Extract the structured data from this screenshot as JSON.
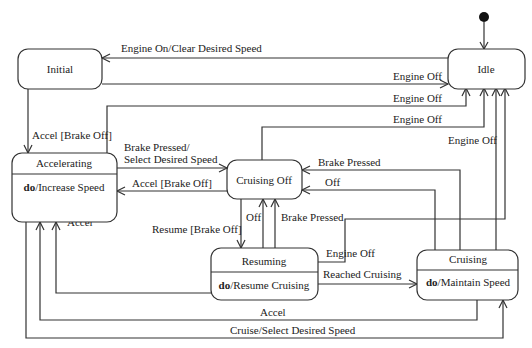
{
  "diagram": {
    "type": "uml-state-machine",
    "initial_pseudostate": {
      "target": "Idle"
    },
    "states": [
      {
        "id": "idle",
        "name": "Idle"
      },
      {
        "id": "initial",
        "name": "Initial"
      },
      {
        "id": "accelerating",
        "name": "Accelerating",
        "activity_kw": "do",
        "activity": "/Increase Speed"
      },
      {
        "id": "cruising_off",
        "name": "Cruising Off"
      },
      {
        "id": "resuming",
        "name": "Resuming",
        "activity_kw": "do",
        "activity": "/Resume Cruising"
      },
      {
        "id": "cruising",
        "name": "Cruising",
        "activity_kw": "do",
        "activity": "/Maintain Speed"
      }
    ],
    "transitions": [
      {
        "from": "Idle",
        "to": "Initial",
        "label": "Engine On/Clear Desired Speed"
      },
      {
        "from": "Initial",
        "to": "Idle",
        "label": "Engine Off"
      },
      {
        "from": "Accelerating",
        "to": "Idle",
        "label": "Engine Off"
      },
      {
        "from": "Cruising Off",
        "to": "Idle",
        "label": "Engine Off"
      },
      {
        "from": "Resuming",
        "to": "Idle",
        "label": "Engine Off"
      },
      {
        "from": "Cruising",
        "to": "Idle",
        "label": "Engine Off"
      },
      {
        "from": "Initial",
        "to": "Accelerating",
        "label": "Accel [Brake Off]"
      },
      {
        "from": "Accelerating",
        "to": "Cruising Off",
        "label_line1": "Brake Pressed/",
        "label_line2": "Select Desired Speed"
      },
      {
        "from": "Cruising Off",
        "to": "Accelerating",
        "label": "Accel [Brake Off]"
      },
      {
        "from": "Cruising",
        "to": "Cruising Off",
        "label": "Brake Pressed"
      },
      {
        "from": "Cruising",
        "to": "Cruising Off",
        "label": "Off"
      },
      {
        "from": "Cruising Off",
        "to": "Resuming",
        "label": "Resume [Brake Off]"
      },
      {
        "from": "Resuming",
        "to": "Cruising Off",
        "label": "Off"
      },
      {
        "from": "Resuming",
        "to": "Cruising Off",
        "label": "Brake Pressed"
      },
      {
        "from": "Resuming",
        "to": "Accelerating",
        "label": "Accel"
      },
      {
        "from": "Resuming",
        "to": "Cruising",
        "label": "Reached Cruising"
      },
      {
        "from": "Cruising",
        "to": "Accelerating",
        "label": "Accel"
      },
      {
        "from": "Accelerating",
        "to": "Cruising",
        "label": "Cruise/Select Desired Speed"
      }
    ]
  },
  "labels": {
    "idle": "Idle",
    "initial": "Initial",
    "accelerating": "Accelerating",
    "accelerating_kw": "do",
    "accelerating_act": "/Increase Speed",
    "cruising_off": "Cruising Off",
    "resuming": "Resuming",
    "resuming_kw": "do",
    "resuming_act": "/Resume Cruising",
    "cruising": "Cruising",
    "cruising_kw": "do",
    "cruising_act": "/Maintain Speed",
    "t_engine_on": "Engine On/Clear Desired Speed",
    "t_initial_engine_off": "Engine Off",
    "t_accel_engine_off": "Engine Off",
    "t_coff_engine_off": "Engine Off",
    "t_cruising_engine_off": "Engine Off",
    "t_resuming_engine_off": "Engine Off",
    "t_initial_accel": "Accel [Brake Off]",
    "t_brake_select_1": "Brake Pressed/",
    "t_brake_select_2": "Select Desired Speed",
    "t_coff_accel": "Accel [Brake Off]",
    "t_cruising_brake": "Brake Pressed",
    "t_cruising_off": "Off",
    "t_resume": "Resume [Brake Off]",
    "t_resuming_off": "Off",
    "t_resuming_brake": "Brake Pressed",
    "t_resuming_accel": "Accel",
    "t_reached": "Reached Cruising",
    "t_cruising_accel": "Accel",
    "t_cruise_select": "Cruise/Select Desired Speed"
  }
}
